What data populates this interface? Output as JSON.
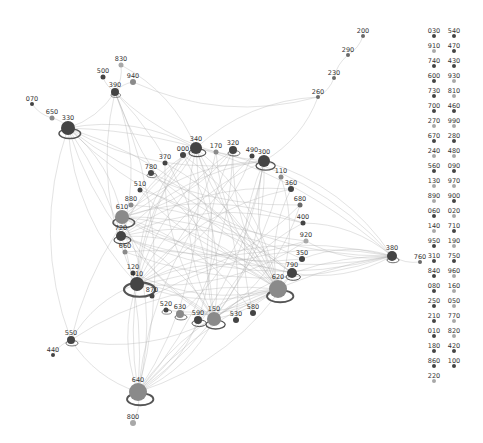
{
  "graph": {
    "title": "Network graph",
    "colors": {
      "edge": "#aaaaaa",
      "node_dark": "#444444",
      "node_mid": "#6a6a6a",
      "node_light": "#8a8a8a",
      "node_pale": "#a8a8a8",
      "loop": "#555555",
      "label": "#333333"
    },
    "nodes": [
      {
        "id": "830",
        "x": 121,
        "y": 65,
        "r": 2.5,
        "c": "node_pale"
      },
      {
        "id": "500",
        "x": 103,
        "y": 77,
        "r": 2.5,
        "c": "node_dark"
      },
      {
        "id": "940",
        "x": 133,
        "y": 82,
        "r": 3,
        "c": "node_light"
      },
      {
        "id": "390",
        "x": 115,
        "y": 92,
        "r": 4,
        "c": "node_dark",
        "loop": 4
      },
      {
        "id": "070",
        "x": 32,
        "y": 104,
        "r": 2,
        "c": "node_dark"
      },
      {
        "id": "650",
        "x": 52,
        "y": 118,
        "r": 2.5,
        "c": "node_light"
      },
      {
        "id": "330",
        "x": 68,
        "y": 128,
        "r": 7,
        "c": "node_dark",
        "loop": 9
      },
      {
        "id": "200",
        "x": 363,
        "y": 36,
        "r": 2,
        "c": "node_mid"
      },
      {
        "id": "290",
        "x": 348,
        "y": 55,
        "r": 2,
        "c": "node_mid"
      },
      {
        "id": "230",
        "x": 334,
        "y": 78,
        "r": 2,
        "c": "node_mid"
      },
      {
        "id": "260",
        "x": 318,
        "y": 97,
        "r": 2,
        "c": "node_mid"
      },
      {
        "id": "340",
        "x": 196,
        "y": 148,
        "r": 6,
        "c": "node_dark",
        "loop": 7
      },
      {
        "id": "000",
        "x": 183,
        "y": 155,
        "r": 3,
        "c": "node_dark"
      },
      {
        "id": "170",
        "x": 216,
        "y": 152,
        "r": 2.5,
        "c": "node_light"
      },
      {
        "id": "320",
        "x": 233,
        "y": 150,
        "r": 4,
        "c": "node_dark",
        "loop": 5
      },
      {
        "id": "490",
        "x": 252,
        "y": 156,
        "r": 2.5,
        "c": "node_dark"
      },
      {
        "id": "300",
        "x": 264,
        "y": 161,
        "r": 6,
        "c": "node_dark",
        "loop": 8
      },
      {
        "id": "370",
        "x": 165,
        "y": 163,
        "r": 2.5,
        "c": "node_dark"
      },
      {
        "id": "780",
        "x": 151,
        "y": 173,
        "r": 3,
        "c": "node_dark",
        "loop": 4
      },
      {
        "id": "110",
        "x": 281,
        "y": 177,
        "r": 2.5,
        "c": "node_light"
      },
      {
        "id": "360",
        "x": 291,
        "y": 189,
        "r": 3,
        "c": "node_dark"
      },
      {
        "id": "510",
        "x": 140,
        "y": 190,
        "r": 2.5,
        "c": "node_dark"
      },
      {
        "id": "880",
        "x": 131,
        "y": 205,
        "r": 2.5,
        "c": "node_light"
      },
      {
        "id": "680",
        "x": 300,
        "y": 205,
        "r": 2.5,
        "c": "node_mid"
      },
      {
        "id": "610",
        "x": 122,
        "y": 217,
        "r": 7,
        "c": "node_light",
        "loop": 9
      },
      {
        "id": "400",
        "x": 303,
        "y": 223,
        "r": 2.5,
        "c": "node_dark"
      },
      {
        "id": "720",
        "x": 121,
        "y": 236,
        "r": 5,
        "c": "node_dark",
        "loop": 7
      },
      {
        "id": "920",
        "x": 306,
        "y": 241,
        "r": 2.5,
        "c": "node_pale"
      },
      {
        "id": "660",
        "x": 125,
        "y": 252,
        "r": 2.5,
        "c": "node_light"
      },
      {
        "id": "350",
        "x": 302,
        "y": 259,
        "r": 3,
        "c": "node_dark"
      },
      {
        "id": "380",
        "x": 392,
        "y": 256,
        "r": 5,
        "c": "node_dark",
        "loop": 5
      },
      {
        "id": "760",
        "x": 420,
        "y": 262,
        "r": 2,
        "c": "node_mid"
      },
      {
        "id": "790",
        "x": 292,
        "y": 273,
        "r": 5,
        "c": "node_dark",
        "loop": 6
      },
      {
        "id": "120",
        "x": 133,
        "y": 273,
        "r": 2.5,
        "c": "node_dark"
      },
      {
        "id": "410",
        "x": 137,
        "y": 284,
        "r": 7,
        "c": "node_dark",
        "loop": 13
      },
      {
        "id": "620",
        "x": 278,
        "y": 289,
        "r": 9,
        "c": "node_light",
        "loop": 11
      },
      {
        "id": "870",
        "x": 152,
        "y": 296,
        "r": 2.5,
        "c": "node_dark"
      },
      {
        "id": "520",
        "x": 166,
        "y": 310,
        "r": 2.5,
        "c": "node_dark",
        "loop": 4
      },
      {
        "id": "630",
        "x": 180,
        "y": 314,
        "r": 4,
        "c": "node_light",
        "loop": 5
      },
      {
        "id": "590",
        "x": 198,
        "y": 320,
        "r": 4,
        "c": "node_dark",
        "loop": 6
      },
      {
        "id": "150",
        "x": 214,
        "y": 319,
        "r": 7,
        "c": "node_light",
        "loop": 8
      },
      {
        "id": "530",
        "x": 236,
        "y": 320,
        "r": 3,
        "c": "node_dark"
      },
      {
        "id": "580",
        "x": 253,
        "y": 313,
        "r": 3,
        "c": "node_dark"
      },
      {
        "id": "550",
        "x": 71,
        "y": 340,
        "r": 4,
        "c": "node_dark",
        "loop": 5
      },
      {
        "id": "440",
        "x": 53,
        "y": 355,
        "r": 2,
        "c": "node_dark"
      },
      {
        "id": "640",
        "x": 138,
        "y": 392,
        "r": 9,
        "c": "node_light",
        "loop": 11
      },
      {
        "id": "800",
        "x": 133,
        "y": 423,
        "r": 3,
        "c": "node_pale"
      }
    ],
    "isolated_nodes": [
      {
        "id": "030",
        "c": "node_dark"
      },
      {
        "id": "540",
        "c": "node_dark"
      },
      {
        "id": "910",
        "c": "node_pale"
      },
      {
        "id": "470",
        "c": "node_dark"
      },
      {
        "id": "740",
        "c": "node_dark"
      },
      {
        "id": "430",
        "c": "node_dark"
      },
      {
        "id": "600",
        "c": "node_dark"
      },
      {
        "id": "930",
        "c": "node_pale"
      },
      {
        "id": "730",
        "c": "node_dark"
      },
      {
        "id": "810",
        "c": "node_pale"
      },
      {
        "id": "700",
        "c": "node_dark"
      },
      {
        "id": "460",
        "c": "node_dark"
      },
      {
        "id": "270",
        "c": "node_pale"
      },
      {
        "id": "990",
        "c": "node_pale"
      },
      {
        "id": "670",
        "c": "node_dark"
      },
      {
        "id": "280",
        "c": "node_dark"
      },
      {
        "id": "240",
        "c": "node_pale"
      },
      {
        "id": "480",
        "c": "node_pale"
      },
      {
        "id": "560",
        "c": "node_dark"
      },
      {
        "id": "090",
        "c": "node_dark"
      },
      {
        "id": "130",
        "c": "node_pale"
      },
      {
        "id": "970",
        "c": "node_pale"
      },
      {
        "id": "890",
        "c": "node_pale"
      },
      {
        "id": "900",
        "c": "node_dark"
      },
      {
        "id": "060",
        "c": "node_dark"
      },
      {
        "id": "020",
        "c": "node_pale"
      },
      {
        "id": "140",
        "c": "node_pale"
      },
      {
        "id": "710",
        "c": "node_dark"
      },
      {
        "id": "950",
        "c": "node_dark"
      },
      {
        "id": "190",
        "c": "node_pale"
      },
      {
        "id": "310",
        "c": "node_dark"
      },
      {
        "id": "750",
        "c": "node_dark"
      },
      {
        "id": "840",
        "c": "node_dark"
      },
      {
        "id": "960",
        "c": "node_pale"
      },
      {
        "id": "080",
        "c": "node_dark"
      },
      {
        "id": "160",
        "c": "node_pale"
      },
      {
        "id": "250",
        "c": "node_dark"
      },
      {
        "id": "050",
        "c": "node_pale"
      },
      {
        "id": "210",
        "c": "node_dark"
      },
      {
        "id": "770",
        "c": "node_pale"
      },
      {
        "id": "010",
        "c": "node_dark"
      },
      {
        "id": "820",
        "c": "node_pale"
      },
      {
        "id": "180",
        "c": "node_dark"
      },
      {
        "id": "420",
        "c": "node_dark"
      },
      {
        "id": "860",
        "c": "node_dark"
      },
      {
        "id": "100",
        "c": "node_dark"
      },
      {
        "id": "220",
        "c": "node_pale"
      }
    ],
    "isolated_grid": {
      "x0": 434,
      "dx": 20,
      "y0": 36,
      "dy": 15
    },
    "edges": [
      [
        "330",
        "340"
      ],
      [
        "330",
        "300"
      ],
      [
        "330",
        "610"
      ],
      [
        "330",
        "410"
      ],
      [
        "330",
        "640"
      ],
      [
        "330",
        "550"
      ],
      [
        "330",
        "620"
      ],
      [
        "330",
        "150"
      ],
      [
        "330",
        "380"
      ],
      [
        "330",
        "650"
      ],
      [
        "650",
        "070"
      ],
      [
        "330",
        "390"
      ],
      [
        "390",
        "500"
      ],
      [
        "390",
        "830"
      ],
      [
        "390",
        "940"
      ],
      [
        "390",
        "620"
      ],
      [
        "390",
        "150"
      ],
      [
        "390",
        "410"
      ],
      [
        "390",
        "640"
      ],
      [
        "390",
        "300"
      ],
      [
        "390",
        "720"
      ],
      [
        "940",
        "260"
      ],
      [
        "830",
        "340"
      ],
      [
        "260",
        "230"
      ],
      [
        "230",
        "290"
      ],
      [
        "290",
        "200"
      ],
      [
        "260",
        "300"
      ],
      [
        "260",
        "340"
      ],
      [
        "340",
        "620"
      ],
      [
        "340",
        "410"
      ],
      [
        "340",
        "640"
      ],
      [
        "340",
        "150"
      ],
      [
        "340",
        "610"
      ],
      [
        "340",
        "790"
      ],
      [
        "340",
        "380"
      ],
      [
        "340",
        "720"
      ],
      [
        "340",
        "590"
      ],
      [
        "300",
        "410"
      ],
      [
        "300",
        "640"
      ],
      [
        "300",
        "610"
      ],
      [
        "300",
        "150"
      ],
      [
        "300",
        "620"
      ],
      [
        "300",
        "380"
      ],
      [
        "300",
        "720"
      ],
      [
        "300",
        "630"
      ],
      [
        "320",
        "410"
      ],
      [
        "320",
        "640"
      ],
      [
        "320",
        "150"
      ],
      [
        "320",
        "610"
      ],
      [
        "320",
        "620"
      ],
      [
        "000",
        "620"
      ],
      [
        "000",
        "410"
      ],
      [
        "000",
        "150"
      ],
      [
        "000",
        "640"
      ],
      [
        "170",
        "410"
      ],
      [
        "170",
        "620"
      ],
      [
        "490",
        "410"
      ],
      [
        "490",
        "640"
      ],
      [
        "370",
        "620"
      ],
      [
        "370",
        "150"
      ],
      [
        "780",
        "620"
      ],
      [
        "780",
        "380"
      ],
      [
        "510",
        "620"
      ],
      [
        "510",
        "790"
      ],
      [
        "610",
        "620"
      ],
      [
        "610",
        "380"
      ],
      [
        "610",
        "790"
      ],
      [
        "610",
        "150"
      ],
      [
        "610",
        "640"
      ],
      [
        "610",
        "350"
      ],
      [
        "720",
        "620"
      ],
      [
        "720",
        "380"
      ],
      [
        "720",
        "150"
      ],
      [
        "720",
        "920"
      ],
      [
        "720",
        "400"
      ],
      [
        "410",
        "620"
      ],
      [
        "410",
        "380"
      ],
      [
        "410",
        "640"
      ],
      [
        "410",
        "150"
      ],
      [
        "410",
        "550"
      ],
      [
        "410",
        "790"
      ],
      [
        "410",
        "680"
      ],
      [
        "410",
        "360"
      ],
      [
        "410",
        "920"
      ],
      [
        "640",
        "620"
      ],
      [
        "640",
        "150"
      ],
      [
        "640",
        "550"
      ],
      [
        "640",
        "790"
      ],
      [
        "640",
        "380"
      ],
      [
        "640",
        "590"
      ],
      [
        "640",
        "800"
      ],
      [
        "550",
        "440"
      ],
      [
        "550",
        "620"
      ],
      [
        "550",
        "150"
      ],
      [
        "550",
        "340"
      ],
      [
        "620",
        "150"
      ],
      [
        "620",
        "630"
      ],
      [
        "620",
        "590"
      ],
      [
        "620",
        "520"
      ],
      [
        "620",
        "110"
      ],
      [
        "620",
        "360"
      ],
      [
        "150",
        "790"
      ],
      [
        "150",
        "380"
      ],
      [
        "150",
        "680"
      ],
      [
        "150",
        "400"
      ],
      [
        "380",
        "760"
      ],
      [
        "380",
        "920"
      ],
      [
        "380",
        "350"
      ],
      [
        "380",
        "790"
      ],
      [
        "380",
        "400"
      ],
      [
        "880",
        "790"
      ],
      [
        "660",
        "380"
      ],
      [
        "660",
        "620"
      ],
      [
        "120",
        "620"
      ],
      [
        "870",
        "380"
      ],
      [
        "530",
        "340"
      ],
      [
        "580",
        "300"
      ],
      [
        "580",
        "610"
      ],
      [
        "110",
        "640"
      ],
      [
        "360",
        "720"
      ],
      [
        "680",
        "330"
      ],
      [
        "400",
        "610"
      ],
      [
        "920",
        "330"
      ],
      [
        "350",
        "720"
      ]
    ]
  }
}
